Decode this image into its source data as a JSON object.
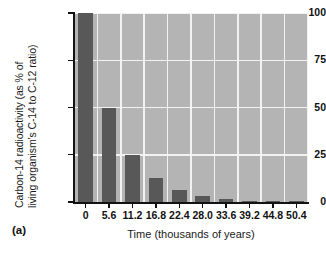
{
  "figure": {
    "caption": "(a)"
  },
  "chart_data": {
    "type": "bar",
    "title": "",
    "xlabel": "Time (thousands of years)",
    "ylabel": "Carbon-14 radioactivity (as % of living organism's C-14 to C-12 ratio)",
    "ylabel_lines": [
      "Carbon-14 radioactivity (as % of",
      "living organism's C-14 to C-12 ratio)"
    ],
    "categories": [
      "0",
      "5.6",
      "11.2",
      "16.8",
      "22.4",
      "28.0",
      "33.6",
      "39.2",
      "44.8",
      "50.4"
    ],
    "x": [
      0,
      5.6,
      11.2,
      16.8,
      22.4,
      28.0,
      33.6,
      39.2,
      44.8,
      50.4
    ],
    "values": [
      100,
      50,
      25,
      12.5,
      6.25,
      3.125,
      1.5625,
      0.78125,
      0.390625,
      0.1953125
    ],
    "ylim": [
      0,
      100
    ],
    "xlim": [
      -2.8,
      53.2
    ],
    "yticks": [
      0,
      25,
      50,
      75,
      100
    ],
    "ytick_labels": [
      "0",
      "25",
      "50",
      "75",
      "100"
    ],
    "xtick_labels": [
      "0",
      "5.6",
      "11.2",
      "16.8",
      "22.4",
      "28.0",
      "33.6",
      "39.2",
      "44.8",
      "50.4"
    ],
    "grid": true,
    "grid_color": "#f2f2f2",
    "legend": null,
    "bar_color": "#585858",
    "plot_background": "#b4b4b4",
    "axis_color": "#121212",
    "bar_width_fraction": 0.62
  }
}
